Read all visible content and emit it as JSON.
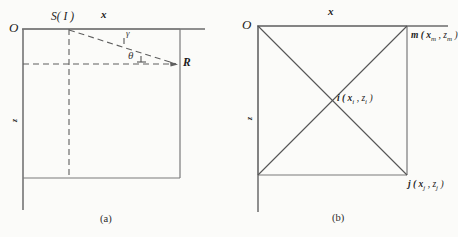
{
  "figure": {
    "background_color": "#fbfbf9",
    "line_color": "#6b6b6b",
    "text_color": "#1c1c1c"
  },
  "panel_a": {
    "caption": "(a)",
    "origin_label": "O",
    "x_axis_label": "x",
    "z_axis_label": "z",
    "source_label": "S( I )",
    "receiver_label": "R",
    "ray_angle_label": "γ",
    "incidence_angle_label": "θ"
  },
  "panel_b": {
    "caption": "(b)",
    "origin_label": "O",
    "x_axis_label": "x",
    "z_axis_label": "z",
    "node_m": "m ( x",
    "node_m_sub1": "m",
    "node_m_mid": " , z",
    "node_m_sub2": "m",
    "node_m_end": " )",
    "node_i": "i ( x",
    "node_i_sub1": "i",
    "node_i_mid": " , z",
    "node_i_sub2": "i",
    "node_i_end": " )",
    "node_j": "j ( x",
    "node_j_sub1": "j",
    "node_j_mid": " , z",
    "node_j_sub2": "j",
    "node_j_end": " )"
  }
}
